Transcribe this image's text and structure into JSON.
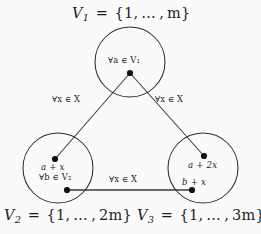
{
  "figure": {
    "kind": "mathematical-diagram",
    "background_color": "#fbfafa",
    "ink_color": "#1d1d1d"
  },
  "captions": {
    "v1": {
      "name": "V",
      "sub": "1",
      "equals": "=",
      "set": "{1, … , m}"
    },
    "v2": {
      "name": "V",
      "sub": "2",
      "equals": "=",
      "set": "{1, … , 2m}"
    },
    "v3": {
      "name": "V",
      "sub": "3",
      "equals": "=",
      "set": "{1, … , 3m}"
    }
  },
  "caption_text": {
    "v1": "V1 = {1,...,m}",
    "v2": "V2 = {1,...,2m}",
    "v3": "V3 = {1,...,3m}"
  },
  "nodes": [
    {
      "id": "v1",
      "caption": "V1 = {1,...,m}",
      "annotation": "∀a ∈ V1",
      "cx": 130,
      "cy": 62,
      "r": 35
    },
    {
      "id": "v2",
      "caption": "V2 = {1,...,2m}",
      "annotation": "∀b ∈ V2",
      "cx": 58,
      "cy": 168,
      "r": 35
    },
    {
      "id": "v3",
      "caption": "V3 = {1,...,3m}",
      "annotation": "",
      "cx": 203,
      "cy": 168,
      "r": 35
    }
  ],
  "annotations": {
    "top_vertex": "∀a ∈ V₁",
    "left_vertex": "∀b ∈ V₂",
    "left_edge": "∀x ∈ X",
    "right_edge": "∀x ∈ X",
    "bottom_edge": "∀x ∈ X",
    "forall": "∀",
    "in": "∈",
    "set_x": "X"
  },
  "vertex_labels": {
    "left_circle": "a + x",
    "right_circle_upper": "a + 2x",
    "right_circle_lower": "b + x"
  },
  "points": [
    {
      "id": "p-top",
      "x": 130,
      "y": 73,
      "label": "",
      "in_circle": "v1"
    },
    {
      "id": "p-left-upper",
      "x": 55,
      "y": 159,
      "label": "a + x",
      "in_circle": "v2"
    },
    {
      "id": "p-left-lower",
      "x": 67,
      "y": 190,
      "label": "",
      "in_circle": "v2"
    },
    {
      "id": "p-right-upper",
      "x": 204,
      "y": 156,
      "label": "a + 2x",
      "in_circle": "v3"
    },
    {
      "id": "p-right-lower",
      "x": 192,
      "y": 190,
      "label": "b + x",
      "in_circle": "v3"
    }
  ],
  "edges": [
    {
      "id": "edge-left",
      "from": "p-top",
      "to": "p-left-upper",
      "label": "∀x ∈ X"
    },
    {
      "id": "edge-right",
      "from": "p-top",
      "to": "p-right-upper",
      "label": "∀x ∈ X"
    },
    {
      "id": "edge-bottom",
      "from": "p-left-lower",
      "to": "p-right-lower",
      "label": "∀x ∈ X"
    }
  ]
}
